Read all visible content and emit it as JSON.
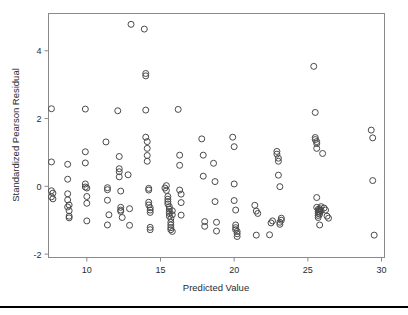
{
  "figure": {
    "width": 408,
    "height": 315,
    "background": "#ffffff",
    "bottom_rule_color": "#000000"
  },
  "chart_data": {
    "type": "scatter",
    "title": "",
    "xlabel": "Predicted Value",
    "ylabel": "Standardized Pearson Residual",
    "xlim": [
      7.4,
      30.2
    ],
    "ylim": [
      -2.1,
      5.1
    ],
    "xticks": [
      10,
      15,
      20,
      25,
      30
    ],
    "xtick_labels": [
      "10",
      "15",
      "20",
      "25",
      "30"
    ],
    "yticks": [
      -2,
      0,
      2,
      4
    ],
    "ytick_labels": [
      "-2",
      "0",
      "2",
      "4"
    ],
    "grid": false,
    "legend": false,
    "marker": "open-circle",
    "marker_color": "#4a4a4a",
    "marker_size": 3.0,
    "n_points": 176,
    "x": [
      7.6,
      7.6,
      7.6,
      7.6,
      7.7,
      7.7,
      8.7,
      8.7,
      8.7,
      8.7,
      8.7,
      8.8,
      8.8,
      8.8,
      8.8,
      9.9,
      9.9,
      9.9,
      9.9,
      9.9,
      10.0,
      10.0,
      10.0,
      10.0,
      11.3,
      11.4,
      11.4,
      11.4,
      11.4,
      11.5,
      12.1,
      12.2,
      12.2,
      12.2,
      12.2,
      12.3,
      12.3,
      12.3,
      12.3,
      12.4,
      12.8,
      12.9,
      12.9,
      13.0,
      13.9,
      14.0,
      14.0,
      14.0,
      14.0,
      14.1,
      14.1,
      14.1,
      14.1,
      14.2,
      14.2,
      14.2,
      14.2,
      14.3,
      14.3,
      14.3,
      14.3,
      14.3,
      15.3,
      15.4,
      15.4,
      15.5,
      15.5,
      15.5,
      15.5,
      15.6,
      15.6,
      15.6,
      15.6,
      15.6,
      15.7,
      15.7,
      15.7,
      15.7,
      15.7,
      15.8,
      15.8,
      15.8,
      16.2,
      16.3,
      16.3,
      16.3,
      16.4,
      16.4,
      16.4,
      17.8,
      17.9,
      17.9,
      18.0,
      18.0,
      18.6,
      18.7,
      18.7,
      18.8,
      18.8,
      19.9,
      20.0,
      20.0,
      20.0,
      20.1,
      20.1,
      20.1,
      20.1,
      20.2,
      20.2,
      20.2,
      21.4,
      21.5,
      21.5,
      21.6,
      22.4,
      22.5,
      22.6,
      22.9,
      22.9,
      23.0,
      23.0,
      23.0,
      23.1,
      23.1,
      23.1,
      23.2,
      23.2,
      25.4,
      25.5,
      25.5,
      25.5,
      25.6,
      25.6,
      25.6,
      25.6,
      25.6,
      25.7,
      25.7,
      25.7,
      25.7,
      25.7,
      25.8,
      25.8,
      25.8,
      25.8,
      25.8,
      25.9,
      25.9,
      26.0,
      26.1,
      26.2,
      26.3,
      26.4,
      29.3,
      29.4,
      29.4,
      29.5
    ],
    "y": [
      2.29,
      0.72,
      -0.13,
      -0.31,
      -0.2,
      -0.37,
      0.65,
      0.21,
      -0.22,
      -0.61,
      -0.4,
      -0.88,
      -0.93,
      -0.72,
      -0.55,
      2.28,
      1.02,
      0.69,
      0.07,
      -0.02,
      -0.05,
      -0.5,
      -1.02,
      -0.3,
      1.31,
      -0.04,
      -0.1,
      -0.41,
      -1.14,
      -0.84,
      2.23,
      0.88,
      0.52,
      0.43,
      0.28,
      -0.14,
      -0.62,
      -0.7,
      -0.74,
      -0.92,
      0.34,
      -0.66,
      -1.15,
      4.78,
      4.64,
      3.33,
      3.26,
      2.25,
      1.45,
      1.32,
      1.12,
      0.91,
      0.74,
      -0.06,
      -0.11,
      -0.47,
      -0.55,
      -0.63,
      -0.7,
      -0.77,
      -1.21,
      -1.28,
      -0.05,
      0.02,
      -0.12,
      -0.3,
      -0.38,
      -0.45,
      -0.52,
      -0.6,
      -0.67,
      -0.74,
      -0.8,
      -0.88,
      -0.95,
      -1.06,
      -1.14,
      -1.22,
      -1.28,
      -1.33,
      -0.72,
      -0.84,
      2.27,
      0.92,
      0.62,
      -0.11,
      -0.23,
      -0.48,
      -0.85,
      1.4,
      0.92,
      0.3,
      -1.04,
      -1.18,
      0.68,
      0.14,
      -0.45,
      -1.06,
      -1.32,
      1.45,
      1.17,
      0.07,
      -0.42,
      -0.7,
      -1.14,
      -1.22,
      -1.28,
      -1.33,
      -1.4,
      -1.48,
      -0.56,
      -0.73,
      -1.44,
      -0.8,
      -1.43,
      -1.08,
      -1.02,
      1.03,
      0.95,
      0.83,
      0.74,
      0.33,
      -0.01,
      -1.06,
      -1.12,
      -1.0,
      -0.94,
      3.54,
      2.18,
      1.44,
      1.38,
      1.32,
      1.26,
      1.12,
      -0.33,
      -0.62,
      -0.68,
      -0.74,
      -0.8,
      -0.86,
      -0.92,
      -0.7,
      -0.76,
      -0.82,
      -1.14,
      -0.66,
      -0.6,
      -0.72,
      0.97,
      -0.64,
      -0.7,
      -0.88,
      -0.94,
      1.66,
      1.43,
      0.17,
      -1.44
    ]
  },
  "axis": {
    "x_title": "Predicted Value",
    "y_title": "Standardized Pearson Residual"
  }
}
